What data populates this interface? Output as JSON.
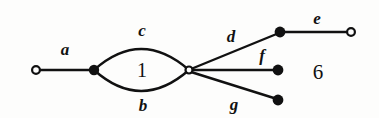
{
  "figure": {
    "number_label": "6",
    "number_pos": {
      "x": 318,
      "y": 72
    },
    "background_color": "#fdfdfc",
    "ink_color": "#111111",
    "width": 379,
    "height": 118
  },
  "diagram": {
    "type": "graph-embedding",
    "stroke_width": 2.4,
    "vertices": [
      {
        "id": "v-left-open",
        "name": "left-open-vertex",
        "style": "open",
        "x": 36,
        "y": 70,
        "r": 5.0
      },
      {
        "id": "v-filled-mid",
        "name": "left-filled-vertex",
        "style": "filled",
        "x": 94,
        "y": 70,
        "r": 5.2
      },
      {
        "id": "v-hub",
        "name": "hub-open-vertex",
        "style": "open",
        "x": 189,
        "y": 70,
        "r": 4.6
      },
      {
        "id": "v-d-end",
        "name": "upper-filled-vertex",
        "style": "filled",
        "x": 280,
        "y": 32,
        "r": 5.4
      },
      {
        "id": "v-e-end",
        "name": "right-open-vertex",
        "style": "open",
        "x": 351,
        "y": 32,
        "r": 5.0
      },
      {
        "id": "v-f-end",
        "name": "middle-filled-vertex",
        "style": "filled",
        "x": 278,
        "y": 70,
        "r": 5.4
      },
      {
        "id": "v-g-end",
        "name": "lower-filled-vertex",
        "style": "filled",
        "x": 278,
        "y": 100,
        "r": 5.4
      }
    ],
    "edges": [
      {
        "id": "edge-a",
        "label": "a",
        "kind": "straight",
        "from": "v-left-open",
        "to": "v-filled-mid",
        "path": "M 38 70 L 94 70",
        "label_pos": {
          "x": 65,
          "y": 49
        }
      },
      {
        "id": "edge-c",
        "label": "c",
        "kind": "arc-upper",
        "from": "v-filled-mid",
        "to": "v-hub",
        "path": "M 94 70 Q 141 28 189 70",
        "label_pos": {
          "x": 142,
          "y": 30
        }
      },
      {
        "id": "edge-b",
        "label": "b",
        "kind": "arc-lower",
        "from": "v-filled-mid",
        "to": "v-hub",
        "path": "M 94 70 Q 141 112 189 70",
        "label_pos": {
          "x": 143,
          "y": 105
        }
      },
      {
        "id": "edge-d",
        "label": "d",
        "kind": "straight",
        "from": "v-hub",
        "to": "v-d-end",
        "path": "M 191 69 L 279 33",
        "label_pos": {
          "x": 231,
          "y": 36
        }
      },
      {
        "id": "edge-e",
        "label": "e",
        "kind": "straight",
        "from": "v-d-end",
        "to": "v-e-end",
        "path": "M 281 32 L 349 32",
        "label_pos": {
          "x": 317,
          "y": 18
        }
      },
      {
        "id": "edge-f",
        "label": "f",
        "kind": "straight",
        "from": "v-hub",
        "to": "v-f-end",
        "path": "M 192 70 L 278 70",
        "label_pos": {
          "x": 262,
          "y": 55
        }
      },
      {
        "id": "edge-g",
        "label": "g",
        "kind": "straight",
        "from": "v-hub",
        "to": "v-g-end",
        "path": "M 191 72 L 277 99",
        "label_pos": {
          "x": 234,
          "y": 104
        }
      }
    ],
    "faces": [
      {
        "id": "face-1",
        "label": "1",
        "name": "bounded-face-label",
        "pos": {
          "x": 142,
          "y": 70
        }
      }
    ]
  }
}
